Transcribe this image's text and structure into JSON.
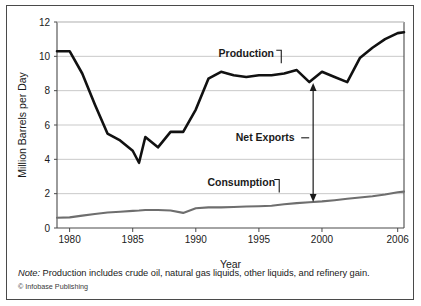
{
  "figure": {
    "note_prefix": "Note:",
    "note_text": " Production includes crude oil, natural gas liquids, other liquids, and refinery gain.",
    "credit": "© Infobase Publishing"
  },
  "colors": {
    "production_line": "#111111",
    "consumption_line": "#6e6e6e",
    "gridline": "#c9c9c9",
    "axis": "#4a4a4a",
    "border": "#4a4a4a",
    "text": "#1a1a1a",
    "background": "#ffffff"
  },
  "chart_data": {
    "type": "line",
    "title": "",
    "subtitle": "",
    "xlabel": "Year",
    "ylabel": "Million Barrels per Day",
    "xlim": [
      1979,
      2006.5
    ],
    "ylim": [
      0,
      12
    ],
    "grid": true,
    "grid_axis": "y",
    "legend_position": "inline-annotations",
    "xticks": [
      1980,
      1985,
      1990,
      1995,
      2000,
      2006
    ],
    "xticklabels": [
      "1980",
      "1985",
      "1990",
      "1995",
      "2000",
      "2006"
    ],
    "yticks": [
      0,
      2,
      4,
      6,
      8,
      10,
      12
    ],
    "yticklabels": [
      "0",
      "2",
      "4",
      "6",
      "8",
      "10",
      "12"
    ],
    "x": [
      1979,
      1980,
      1981,
      1982,
      1983,
      1984,
      1985,
      1985.5,
      1986,
      1987,
      1988,
      1989,
      1990,
      1991,
      1992,
      1993,
      1994,
      1995,
      1996,
      1997,
      1998,
      1999,
      2000,
      2001,
      2002,
      2003,
      2004,
      2005,
      2006,
      2006.5
    ],
    "series": [
      {
        "name": "Production",
        "color": "#111111",
        "values": [
          10.3,
          10.3,
          9.0,
          7.2,
          5.5,
          5.1,
          4.5,
          3.8,
          5.3,
          4.7,
          5.6,
          5.6,
          6.9,
          8.7,
          9.1,
          8.9,
          8.8,
          8.9,
          8.9,
          9.0,
          9.2,
          8.5,
          9.1,
          8.8,
          8.5,
          9.9,
          10.5,
          11.0,
          11.35,
          11.4
        ]
      },
      {
        "name": "Consumption",
        "color": "#6e6e6e",
        "values": [
          0.6,
          0.62,
          0.72,
          0.82,
          0.9,
          0.95,
          1.0,
          1.02,
          1.05,
          1.05,
          1.02,
          0.88,
          1.15,
          1.2,
          1.2,
          1.22,
          1.25,
          1.27,
          1.3,
          1.38,
          1.45,
          1.5,
          1.55,
          1.62,
          1.7,
          1.78,
          1.85,
          1.95,
          2.08,
          2.12
        ]
      }
    ],
    "annotations": [
      {
        "name": "production-label",
        "text": "Production",
        "x": 1994.0,
        "y": 9.95,
        "leader": "elbow-down-right"
      },
      {
        "name": "consumption-label",
        "text": "Consumption",
        "x": 1993.6,
        "y": 2.42,
        "leader": "elbow-down-right"
      },
      {
        "name": "net-exports-label",
        "text": "Net Exports",
        "x": 1995.5,
        "y": 5.05,
        "leader": "dash-right"
      }
    ],
    "arrow": {
      "name": "net-exports-arrow",
      "x": 1999.3,
      "y_top": 8.45,
      "y_bottom": 1.52,
      "double_headed": true
    }
  }
}
